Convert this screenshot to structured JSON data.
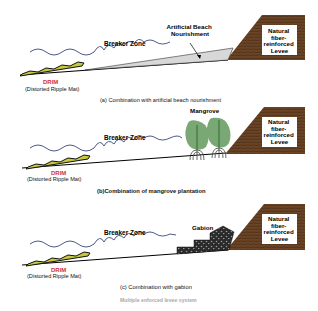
{
  "colors": {
    "wave": "#4a5a8a",
    "levee": "#6b4426",
    "levee_grain": "#3e2612",
    "drim_red": "#d0322a",
    "mat_yellow": "#c8c83c",
    "tree_green": "#7aa874",
    "tree_trunk": "#2f6b2f",
    "nourishment": "#d8d8d8",
    "gabion": "#2a2a2a"
  },
  "panels": [
    {
      "id": "a",
      "breaker_zone": "Breaker Zone",
      "feature_label_line1": "Artificial Beach",
      "feature_label_line2": "Nourishment",
      "levee": [
        "Natural",
        "fiber-",
        "reinforced",
        "Levee"
      ],
      "drim_title": "DRIM",
      "drim_sub": "(Distorted Ripple Mat)",
      "caption": "(a) Combination with artificial beach nourishment"
    },
    {
      "id": "b",
      "breaker_zone": "Breaker Zone",
      "feature_label_line1": "Mangrove",
      "levee": [
        "Natural",
        "fiber-",
        "reinforced",
        "Levee"
      ],
      "drim_title": "DRIM",
      "drim_sub": "(Distorted Ripple Mat)",
      "caption": "(b)Combination of  mangrove plantation"
    },
    {
      "id": "c",
      "breaker_zone": "Breaker Zone",
      "feature_label_line1": "Gabion",
      "levee": [
        "Natural",
        "fiber-",
        "reinforced",
        "Levee"
      ],
      "drim_title": "DRIM",
      "drim_sub": "(Distorted Ripple Mat)",
      "caption": "(c) Combination with gabion"
    }
  ],
  "footer_partial": "Multiple enforced levee system"
}
